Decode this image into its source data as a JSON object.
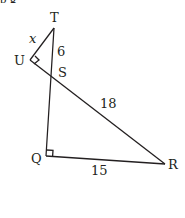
{
  "caption_fragment": "p                                  g",
  "diagram": {
    "vertices": {
      "T": {
        "label": "T",
        "x": 54,
        "y": 28
      },
      "U": {
        "label": "U",
        "x": 30,
        "y": 60
      },
      "S": {
        "label": "S",
        "x": 51,
        "y": 77
      },
      "Q": {
        "label": "Q",
        "x": 46,
        "y": 156
      },
      "R": {
        "label": "R",
        "x": 165,
        "y": 164
      }
    },
    "segments": {
      "TU": {
        "label": "x",
        "italic": true
      },
      "TS": {
        "label": "6"
      },
      "SR": {
        "label": "18"
      },
      "QR": {
        "label": "15"
      }
    },
    "right_angles": [
      "U",
      "Q"
    ],
    "line_color": "#231f20"
  }
}
